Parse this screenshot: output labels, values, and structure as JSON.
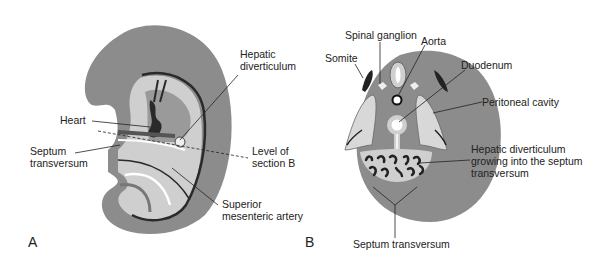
{
  "panel_a": {
    "letter": "A",
    "labels": {
      "hepatic_line1": "Hepatic",
      "hepatic_line2": "diverticulum",
      "heart": "Heart",
      "septum_line1": "Septum",
      "septum_line2": "transversum",
      "level_line1": "Level of",
      "level_line2": "section B",
      "sma_line1": "Superior",
      "sma_line2": "mesenteric artery"
    }
  },
  "panel_b": {
    "letter": "B",
    "labels": {
      "spinal_ganglion": "Spinal ganglion",
      "aorta": "Aorta",
      "somite": "Somite",
      "duodenum": "Duodenum",
      "peritoneal_cavity": "Peritoneal cavity",
      "hepdiv_line1": "Hepatic diverticulum",
      "hepdiv_line2": "growing into the septum",
      "hepdiv_line3": "transversum",
      "septum_transversum": "Septum transversum"
    }
  },
  "colors": {
    "tissue_gray": "#8c8c8c",
    "light_gray": "#cfcfcf",
    "dark": "#2a2a2a",
    "white": "#ffffff"
  }
}
